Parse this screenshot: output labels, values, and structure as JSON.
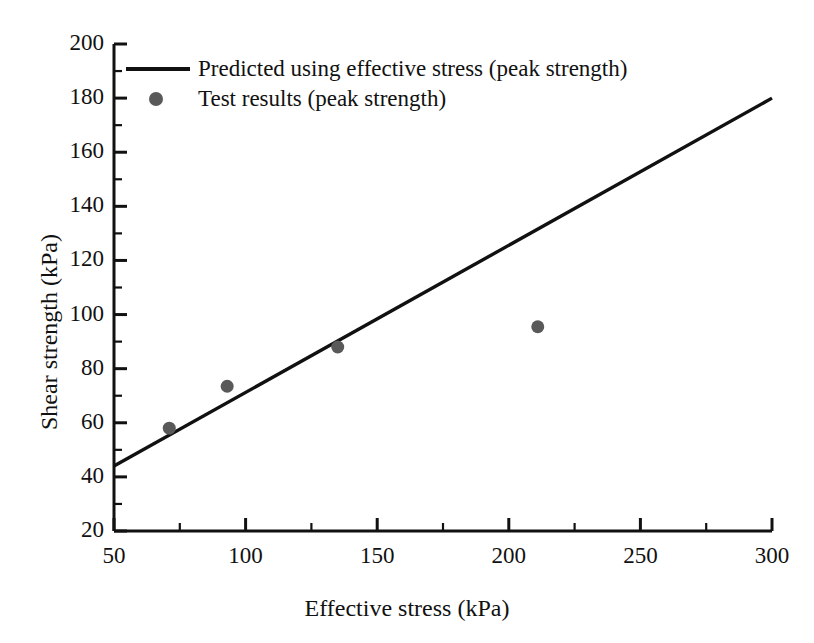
{
  "chart_data": {
    "type": "scatter",
    "title": "",
    "xlabel": "Effective stress (kPa)",
    "ylabel": "Shear strength (kPa)",
    "xlim": [
      50,
      300
    ],
    "ylim": [
      20,
      200
    ],
    "xticks": [
      50,
      100,
      150,
      200,
      250,
      300
    ],
    "xtick_labels": [
      "50",
      "100",
      "150",
      "200",
      "250",
      "300"
    ],
    "yticks": [
      20,
      40,
      60,
      80,
      100,
      120,
      140,
      160,
      180,
      200
    ],
    "ytick_labels": [
      "20",
      "40",
      "60",
      "80",
      "100",
      "120",
      "140",
      "160",
      "180",
      "200"
    ],
    "x_minor_step": 25,
    "y_minor_step": 10,
    "grid": false,
    "legend_position": "top-left-inside",
    "series": [
      {
        "name": "Predicted using effective stress (peak strength)",
        "type": "line",
        "color": "#111111",
        "linewidth": 3.4,
        "x": [
          50,
          300
        ],
        "y": [
          44,
          180
        ]
      },
      {
        "name": "Test results (peak strength)",
        "type": "scatter",
        "color": "#595959",
        "marker": "circle",
        "marker_size": 13,
        "x": [
          71,
          93,
          135,
          211
        ],
        "y": [
          58,
          73.5,
          88,
          95.5
        ]
      }
    ]
  },
  "legend": {
    "entries": [
      {
        "label": "Predicted using effective stress (peak strength)",
        "marker": "line-swatch"
      },
      {
        "label": "Test results (peak strength)",
        "marker": "dot-swatch"
      }
    ]
  },
  "axes": {
    "x_title": "Effective stress (kPa)",
    "y_title": "Shear strength (kPa)"
  },
  "colors": {
    "line": "#111111",
    "marker": "#595959",
    "axis": "#111111",
    "background": "#ffffff"
  }
}
